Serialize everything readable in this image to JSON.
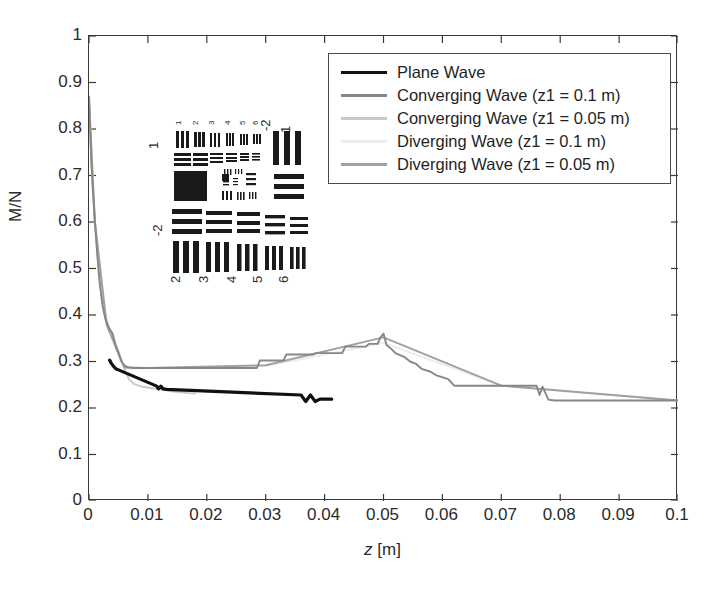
{
  "figure": {
    "name": "mn-vs-z-plot",
    "background": "#ffffff"
  },
  "axes": {
    "x": {
      "label_plain": "z [m]",
      "label_italic_part": "z",
      "label_rest": " [m]",
      "min": 0,
      "max": 0.1,
      "tick_step": 0.01,
      "ticks": [
        "0",
        "0.01",
        "0.02",
        "0.03",
        "0.04",
        "0.05",
        "0.06",
        "0.07",
        "0.08",
        "0.09",
        "0.1"
      ]
    },
    "y": {
      "label": "M/N",
      "min": 0,
      "max": 1,
      "tick_step": 0.1,
      "ticks": [
        "1",
        "0.9",
        "0.8",
        "0.7",
        "0.6",
        "0.5",
        "0.4",
        "0.3",
        "0.2",
        "0.1",
        "0"
      ]
    },
    "frame_color": "#3a3a3a",
    "grid": false
  },
  "legend": {
    "position": "top-right-inside",
    "border_color": "#4a4a4a",
    "entries": [
      {
        "label": "Plane Wave",
        "color": "#111111"
      },
      {
        "label": "Converging Wave (z1 = 0.1 m)",
        "color": "#878787"
      },
      {
        "label": "Converging Wave (z1 = 0.05 m)",
        "color": "#c8c8c8"
      },
      {
        "label": "Diverging Wave (z1 = 0.1 m)",
        "color": "#ececec"
      },
      {
        "label": "Diverging Wave (z1 = 0.05 m)",
        "color": "#a0a0a0"
      }
    ]
  },
  "inset": {
    "name": "usaf-1951-resolution-target",
    "description": "USAF 1951 resolution test chart image",
    "group_labels_top": [
      "1",
      "2",
      "3",
      "4",
      "5",
      "6"
    ],
    "group_labels_bottom": [
      "2",
      "3",
      "4",
      "5",
      "6"
    ],
    "group_labels_left": [
      "1",
      "-2"
    ],
    "group_labels_right": [
      "-2",
      "1"
    ]
  },
  "chart_data": {
    "type": "line",
    "title": "",
    "xlabel": "z [m]",
    "ylabel": "M/N",
    "xlim": [
      0,
      0.1
    ],
    "ylim": [
      0,
      1
    ],
    "grid": false,
    "legend_position": "upper right",
    "series": [
      {
        "name": "Plane Wave",
        "color": "#111111",
        "note": "only short visible fragments; mostly hidden beneath other curves",
        "x": [
          0.0035,
          0.0038,
          0.0042,
          0.0046,
          0.005,
          0.0115,
          0.0118,
          0.0122,
          0.0126,
          0.0132,
          0.036,
          0.0368,
          0.0376,
          0.0384,
          0.0392,
          0.04,
          0.0412
        ],
        "y": [
          0.303,
          0.296,
          0.289,
          0.284,
          0.282,
          0.247,
          0.241,
          0.247,
          0.241,
          0.24,
          0.228,
          0.214,
          0.228,
          0.214,
          0.219,
          0.219,
          0.219
        ]
      },
      {
        "name": "Converging Wave (z1 = 0.1 m)",
        "color": "#878787",
        "x": [
          0.0,
          0.0002,
          0.0004,
          0.0007,
          0.001,
          0.0014,
          0.0018,
          0.0023,
          0.0028,
          0.0034,
          0.004,
          0.0046,
          0.005,
          0.0055,
          0.006,
          0.0065,
          0.0075,
          0.01,
          0.015,
          0.02,
          0.025,
          0.0285,
          0.029,
          0.033,
          0.0335,
          0.038,
          0.0385,
          0.043,
          0.0435,
          0.047,
          0.0475,
          0.049,
          0.0495,
          0.05,
          0.0505,
          0.0515,
          0.052,
          0.0535,
          0.0545,
          0.0555,
          0.0565,
          0.058,
          0.059,
          0.061,
          0.062,
          0.066,
          0.076,
          0.0765,
          0.077,
          0.078,
          0.079,
          0.085,
          0.095,
          0.1
        ],
        "y": [
          0.87,
          0.8,
          0.73,
          0.66,
          0.6,
          0.53,
          0.47,
          0.42,
          0.39,
          0.372,
          0.36,
          0.33,
          0.318,
          0.3,
          0.292,
          0.288,
          0.286,
          0.286,
          0.286,
          0.286,
          0.286,
          0.286,
          0.302,
          0.302,
          0.315,
          0.315,
          0.318,
          0.318,
          0.332,
          0.332,
          0.338,
          0.338,
          0.352,
          0.36,
          0.336,
          0.325,
          0.318,
          0.31,
          0.3,
          0.295,
          0.284,
          0.278,
          0.27,
          0.262,
          0.248,
          0.248,
          0.248,
          0.228,
          0.246,
          0.218,
          0.216,
          0.216,
          0.216,
          0.216
        ]
      },
      {
        "name": "Converging Wave (z1 = 0.05 m)",
        "color": "#c8c8c8",
        "note": "fades out around z = 0.018",
        "x": [
          0.0,
          0.0003,
          0.0006,
          0.001,
          0.0015,
          0.002,
          0.0026,
          0.0032,
          0.004,
          0.0048,
          0.0056,
          0.0062,
          0.0068,
          0.0076,
          0.009,
          0.0105,
          0.012,
          0.014,
          0.016,
          0.018
        ],
        "y": [
          0.86,
          0.76,
          0.68,
          0.6,
          0.52,
          0.455,
          0.41,
          0.38,
          0.355,
          0.33,
          0.3,
          0.278,
          0.262,
          0.252,
          0.246,
          0.243,
          0.24,
          0.236,
          0.233,
          0.231
        ]
      },
      {
        "name": "Diverging Wave (z1 = 0.1 m)",
        "color": "#ececec",
        "note": "nearly invisible, overlaps the other traces",
        "x": [
          0.0,
          0.001,
          0.003,
          0.006,
          0.01,
          0.03,
          0.05,
          0.07,
          0.1
        ],
        "y": [
          0.865,
          0.6,
          0.38,
          0.288,
          0.286,
          0.29,
          0.34,
          0.248,
          0.216
        ]
      },
      {
        "name": "Diverging Wave (z1 = 0.05 m)",
        "color": "#a0a0a0",
        "note": "overlaps the converging 0.1 m trace over most of the range",
        "x": [
          0.0,
          0.001,
          0.003,
          0.006,
          0.01,
          0.03,
          0.05,
          0.07,
          0.1
        ],
        "y": [
          0.868,
          0.602,
          0.378,
          0.287,
          0.286,
          0.292,
          0.352,
          0.248,
          0.216
        ]
      }
    ]
  }
}
